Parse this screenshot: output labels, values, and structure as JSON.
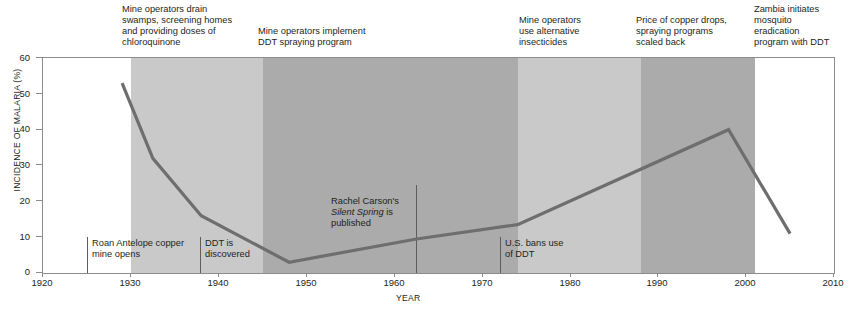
{
  "chart_data": {
    "type": "line",
    "title": "",
    "xlabel": "YEAR",
    "ylabel": "INCIDENCE OF MALARIA (%)",
    "xlim": [
      1920,
      2010
    ],
    "ylim": [
      0,
      60
    ],
    "grid": false,
    "legend": "none",
    "x_ticks": [
      1920,
      1930,
      1940,
      1950,
      1960,
      1970,
      1980,
      1990,
      2000,
      2010
    ],
    "y_ticks": [
      0,
      10,
      20,
      30,
      40,
      50,
      60
    ],
    "series": [
      {
        "name": "Incidence of malaria",
        "color": "#6e6e6e",
        "points": [
          {
            "x": 1929,
            "y": 53
          },
          {
            "x": 1932.5,
            "y": 32
          },
          {
            "x": 1938,
            "y": 16
          },
          {
            "x": 1948,
            "y": 3
          },
          {
            "x": 1962.5,
            "y": 9.5
          },
          {
            "x": 1974,
            "y": 13.5
          },
          {
            "x": 1998,
            "y": 40
          },
          {
            "x": 2005,
            "y": 11
          }
        ]
      }
    ],
    "bands": [
      {
        "name": "pre-intervention",
        "start": 1920,
        "end": 1930,
        "color": "#ffffff"
      },
      {
        "name": "drainage-and-chloroquinone",
        "start": 1930,
        "end": 1945,
        "color": "#c9c9c9"
      },
      {
        "name": "ddt-spraying",
        "start": 1945,
        "end": 1974,
        "color": "#ababab"
      },
      {
        "name": "alternative-insecticides",
        "start": 1974,
        "end": 1988,
        "color": "#c9c9c9"
      },
      {
        "name": "spraying-scaled-back",
        "start": 1988,
        "end": 2001,
        "color": "#ababab"
      },
      {
        "name": "zambia-eradication",
        "start": 2001,
        "end": 2010,
        "color": "#ffffff"
      }
    ],
    "top_annotations": [
      {
        "id": "drain-swamps",
        "x": 1930,
        "text": "Mine operators drain\nswamps, screening homes\nand providing doses of\nchloroquinone"
      },
      {
        "id": "ddt-spraying-program",
        "x": 1945,
        "text": "Mine operators implement\nDDT spraying program"
      },
      {
        "id": "alternative-insecticides",
        "x": 1974,
        "text": "Mine operators\nuse alternative\ninsecticides"
      },
      {
        "id": "copper-price-drop",
        "x": 1988,
        "text": "Price of copper drops,\nspraying programs\nscaled back"
      },
      {
        "id": "zambia-eradication",
        "x": 2001,
        "text": "Zambia initiates\nmosquito\neradication\nprogram with DDT"
      }
    ],
    "event_markers": [
      {
        "id": "roan-antelope-mine",
        "x": 1925,
        "line_top": 9.9,
        "line_bottom": 0,
        "text": "Roan Antelope copper\nmine opens"
      },
      {
        "id": "ddt-discovered",
        "x": 1938,
        "line_top": 9.9,
        "line_bottom": 0,
        "text": "DDT is\ndiscovered"
      },
      {
        "id": "silent-spring",
        "x": 1962.5,
        "line_top": 24.5,
        "line_bottom": 0,
        "text_before": "Rachel Carson's\n",
        "text_italic": "Silent Spring",
        "text_after": " is\npublished"
      },
      {
        "id": "us-bans-ddt",
        "x": 1972,
        "line_top": 9.9,
        "line_bottom": 0,
        "text": "U.S. bans use\nof DDT"
      }
    ]
  },
  "colors": {
    "line": "#6e6e6e",
    "frame": "#8c8c8c",
    "text": "#231f20",
    "band_light": "#c9c9c9",
    "band_dark": "#ababab",
    "band_none": "#ffffff"
  }
}
